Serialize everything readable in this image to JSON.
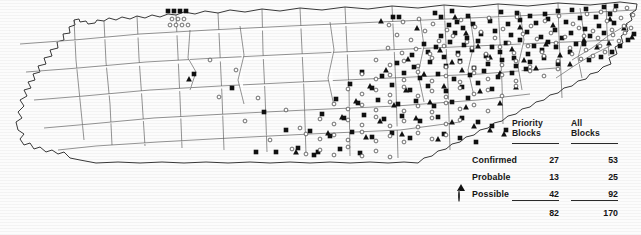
{
  "figure": {
    "type": "distribution-map",
    "region": "Tennessee",
    "background_color": "#fcfcfc",
    "line_color": "#3a3a3a"
  },
  "table": {
    "columns": [
      {
        "id": "priority",
        "line1": "Priority",
        "line2": "Blocks"
      },
      {
        "id": "all",
        "line1": "All",
        "line2": "Blocks"
      }
    ],
    "rows": [
      {
        "symbol": "filled-square",
        "label": "Confirmed",
        "priority": "27",
        "all": "53"
      },
      {
        "symbol": "filled-triangle",
        "label": "Probable",
        "priority": "13",
        "all": "25"
      },
      {
        "symbol": "open-circle",
        "label": "Possible",
        "priority": "42",
        "all": "92"
      }
    ],
    "totals": {
      "priority": "82",
      "all": "170"
    }
  },
  "chart_data": {
    "type": "map",
    "title": "",
    "legend_position": "bottom-right",
    "categories": [
      "Confirmed",
      "Probable",
      "Possible"
    ],
    "series": [
      {
        "name": "Priority Blocks",
        "values": [
          27,
          13,
          42
        ],
        "total": 82
      },
      {
        "name": "All Blocks",
        "values": [
          53,
          25,
          92
        ],
        "total": 170
      }
    ],
    "symbols": {
      "Confirmed": "filled-square",
      "Probable": "filled-triangle",
      "Possible": "open-circle"
    },
    "markers": {
      "confirmed": [
        [
          168,
          11
        ],
        [
          174,
          11
        ],
        [
          180,
          11
        ],
        [
          186,
          11
        ],
        [
          393,
          17
        ],
        [
          399,
          17
        ],
        [
          435,
          13
        ],
        [
          441,
          17
        ],
        [
          452,
          11
        ],
        [
          468,
          16
        ],
        [
          501,
          12
        ],
        [
          517,
          13
        ],
        [
          530,
          16
        ],
        [
          545,
          14
        ],
        [
          558,
          11
        ],
        [
          572,
          10
        ],
        [
          586,
          9
        ],
        [
          604,
          7
        ],
        [
          616,
          6
        ],
        [
          449,
          25
        ],
        [
          457,
          22
        ],
        [
          463,
          28
        ],
        [
          473,
          24
        ],
        [
          490,
          21
        ],
        [
          508,
          24
        ],
        [
          520,
          20
        ],
        [
          536,
          23
        ],
        [
          548,
          19
        ],
        [
          566,
          22
        ],
        [
          580,
          18
        ],
        [
          596,
          17
        ],
        [
          610,
          14
        ],
        [
          441,
          36
        ],
        [
          455,
          33
        ],
        [
          467,
          38
        ],
        [
          481,
          34
        ],
        [
          495,
          31
        ],
        [
          511,
          35
        ],
        [
          527,
          32
        ],
        [
          541,
          37
        ],
        [
          555,
          30
        ],
        [
          571,
          33
        ],
        [
          585,
          29
        ],
        [
          599,
          26
        ],
        [
          614,
          23
        ],
        [
          424,
          44
        ],
        [
          436,
          47
        ],
        [
          450,
          42
        ],
        [
          464,
          45
        ],
        [
          478,
          41
        ],
        [
          492,
          47
        ],
        [
          506,
          43
        ],
        [
          520,
          40
        ],
        [
          534,
          46
        ],
        [
          548,
          42
        ],
        [
          562,
          38
        ],
        [
          576,
          44
        ],
        [
          590,
          36
        ],
        [
          604,
          33
        ],
        [
          412,
          55
        ],
        [
          428,
          52
        ],
        [
          444,
          57
        ],
        [
          458,
          53
        ],
        [
          472,
          50
        ],
        [
          486,
          56
        ],
        [
          500,
          52
        ],
        [
          514,
          58
        ],
        [
          528,
          54
        ],
        [
          542,
          50
        ],
        [
          556,
          47
        ],
        [
          570,
          52
        ],
        [
          584,
          44
        ],
        [
          397,
          63
        ],
        [
          414,
          67
        ],
        [
          430,
          62
        ],
        [
          446,
          66
        ],
        [
          460,
          61
        ],
        [
          474,
          68
        ],
        [
          488,
          64
        ],
        [
          502,
          60
        ],
        [
          516,
          66
        ],
        [
          530,
          62
        ],
        [
          544,
          58
        ],
        [
          558,
          64
        ],
        [
          362,
          72
        ],
        [
          382,
          76
        ],
        [
          404,
          73
        ],
        [
          420,
          78
        ],
        [
          438,
          74
        ],
        [
          454,
          79
        ],
        [
          470,
          75
        ],
        [
          484,
          71
        ],
        [
          498,
          77
        ],
        [
          512,
          73
        ],
        [
          526,
          69
        ],
        [
          350,
          84
        ],
        [
          372,
          88
        ],
        [
          392,
          85
        ],
        [
          410,
          90
        ],
        [
          428,
          86
        ],
        [
          446,
          91
        ],
        [
          462,
          87
        ],
        [
          478,
          83
        ],
        [
          492,
          89
        ],
        [
          336,
          99
        ],
        [
          358,
          103
        ],
        [
          378,
          100
        ],
        [
          398,
          104
        ],
        [
          416,
          101
        ],
        [
          434,
          106
        ],
        [
          452,
          102
        ],
        [
          468,
          98
        ],
        [
          322,
          114
        ],
        [
          344,
          118
        ],
        [
          364,
          115
        ],
        [
          384,
          119
        ],
        [
          402,
          116
        ],
        [
          420,
          121
        ],
        [
          438,
          117
        ],
        [
          310,
          131
        ],
        [
          330,
          136
        ],
        [
          352,
          132
        ],
        [
          372,
          137
        ],
        [
          392,
          133
        ],
        [
          410,
          138
        ],
        [
          298,
          148
        ],
        [
          318,
          152
        ],
        [
          340,
          149
        ],
        [
          360,
          153
        ],
        [
          194,
          74
        ],
        [
          232,
          88
        ],
        [
          264,
          112
        ],
        [
          286,
          130
        ],
        [
          256,
          152
        ],
        [
          276,
          152
        ],
        [
          314,
          155
        ],
        [
          589,
          60
        ],
        [
          601,
          57
        ],
        [
          612,
          52
        ],
        [
          620,
          46
        ],
        [
          628,
          40
        ],
        [
          634,
          34
        ],
        [
          462,
          118
        ],
        [
          478,
          122
        ],
        [
          492,
          126
        ],
        [
          506,
          130
        ],
        [
          444,
          134
        ],
        [
          460,
          138
        ],
        [
          476,
          142
        ]
      ],
      "probable": [
        [
          189,
          79
        ],
        [
          381,
          21
        ],
        [
          455,
          17
        ],
        [
          417,
          28
        ],
        [
          520,
          27
        ],
        [
          466,
          33
        ],
        [
          553,
          25
        ],
        [
          440,
          50
        ],
        [
          478,
          46
        ],
        [
          512,
          49
        ],
        [
          546,
          44
        ],
        [
          584,
          40
        ],
        [
          408,
          59
        ],
        [
          452,
          62
        ],
        [
          490,
          57
        ],
        [
          524,
          60
        ],
        [
          560,
          55
        ],
        [
          386,
          70
        ],
        [
          424,
          74
        ],
        [
          462,
          70
        ],
        [
          500,
          73
        ],
        [
          536,
          68
        ],
        [
          570,
          64
        ],
        [
          370,
          86
        ],
        [
          406,
          90
        ],
        [
          444,
          86
        ],
        [
          480,
          91
        ],
        [
          516,
          87
        ],
        [
          356,
          101
        ],
        [
          394,
          105
        ],
        [
          430,
          102
        ],
        [
          466,
          107
        ],
        [
          500,
          103
        ],
        [
          342,
          117
        ],
        [
          380,
          121
        ],
        [
          416,
          118
        ],
        [
          452,
          122
        ],
        [
          328,
          133
        ],
        [
          366,
          137
        ],
        [
          402,
          134
        ],
        [
          438,
          139
        ],
        [
          296,
          152
        ],
        [
          474,
          126
        ],
        [
          490,
          130
        ],
        [
          504,
          134
        ],
        [
          610,
          19
        ],
        [
          624,
          28
        ],
        [
          632,
          37
        ],
        [
          597,
          47
        ],
        [
          609,
          43
        ]
      ],
      "possible": [
        [
          172,
          19
        ],
        [
          178,
          19
        ],
        [
          184,
          19
        ],
        [
          170,
          25
        ],
        [
          176,
          25
        ],
        [
          182,
          25
        ],
        [
          188,
          25
        ],
        [
          389,
          25
        ],
        [
          403,
          22
        ],
        [
          419,
          19
        ],
        [
          433,
          24
        ],
        [
          447,
          30
        ],
        [
          461,
          20
        ],
        [
          475,
          27
        ],
        [
          489,
          18
        ],
        [
          503,
          29
        ],
        [
          517,
          17
        ],
        [
          531,
          26
        ],
        [
          545,
          21
        ],
        [
          559,
          16
        ],
        [
          573,
          24
        ],
        [
          587,
          14
        ],
        [
          601,
          12
        ],
        [
          615,
          10
        ],
        [
          627,
          8
        ],
        [
          397,
          35
        ],
        [
          411,
          40
        ],
        [
          425,
          31
        ],
        [
          439,
          41
        ],
        [
          453,
          36
        ],
        [
          467,
          42
        ],
        [
          481,
          32
        ],
        [
          495,
          38
        ],
        [
          509,
          43
        ],
        [
          523,
          34
        ],
        [
          537,
          39
        ],
        [
          551,
          33
        ],
        [
          565,
          37
        ],
        [
          579,
          28
        ],
        [
          593,
          31
        ],
        [
          607,
          21
        ],
        [
          621,
          18
        ],
        [
          633,
          15
        ],
        [
          388,
          48
        ],
        [
          402,
          53
        ],
        [
          416,
          49
        ],
        [
          430,
          54
        ],
        [
          444,
          46
        ],
        [
          458,
          55
        ],
        [
          472,
          48
        ],
        [
          486,
          54
        ],
        [
          500,
          47
        ],
        [
          514,
          53
        ],
        [
          528,
          46
        ],
        [
          542,
          52
        ],
        [
          556,
          43
        ],
        [
          570,
          48
        ],
        [
          584,
          36
        ],
        [
          598,
          38
        ],
        [
          612,
          30
        ],
        [
          624,
          26
        ],
        [
          376,
          60
        ],
        [
          390,
          65
        ],
        [
          404,
          61
        ],
        [
          418,
          66
        ],
        [
          432,
          58
        ],
        [
          446,
          67
        ],
        [
          460,
          62
        ],
        [
          474,
          68
        ],
        [
          488,
          59
        ],
        [
          502,
          65
        ],
        [
          516,
          61
        ],
        [
          530,
          67
        ],
        [
          544,
          56
        ],
        [
          558,
          61
        ],
        [
          572,
          54
        ],
        [
          586,
          50
        ],
        [
          600,
          46
        ],
        [
          362,
          74
        ],
        [
          376,
          79
        ],
        [
          390,
          75
        ],
        [
          404,
          80
        ],
        [
          418,
          72
        ],
        [
          432,
          81
        ],
        [
          446,
          76
        ],
        [
          460,
          82
        ],
        [
          474,
          73
        ],
        [
          488,
          79
        ],
        [
          502,
          75
        ],
        [
          516,
          81
        ],
        [
          530,
          71
        ],
        [
          544,
          76
        ],
        [
          558,
          69
        ],
        [
          348,
          89
        ],
        [
          362,
          94
        ],
        [
          376,
          90
        ],
        [
          390,
          95
        ],
        [
          404,
          87
        ],
        [
          418,
          96
        ],
        [
          432,
          91
        ],
        [
          446,
          97
        ],
        [
          460,
          88
        ],
        [
          474,
          94
        ],
        [
          488,
          90
        ],
        [
          502,
          96
        ],
        [
          516,
          86
        ],
        [
          334,
          104
        ],
        [
          348,
          109
        ],
        [
          362,
          105
        ],
        [
          376,
          110
        ],
        [
          390,
          102
        ],
        [
          404,
          111
        ],
        [
          418,
          106
        ],
        [
          432,
          112
        ],
        [
          446,
          103
        ],
        [
          460,
          109
        ],
        [
          474,
          105
        ],
        [
          488,
          111
        ],
        [
          320,
          119
        ],
        [
          334,
          124
        ],
        [
          348,
          120
        ],
        [
          362,
          125
        ],
        [
          376,
          117
        ],
        [
          390,
          126
        ],
        [
          404,
          121
        ],
        [
          418,
          127
        ],
        [
          432,
          118
        ],
        [
          446,
          124
        ],
        [
          460,
          120
        ],
        [
          306,
          134
        ],
        [
          320,
          139
        ],
        [
          334,
          135
        ],
        [
          348,
          140
        ],
        [
          362,
          132
        ],
        [
          376,
          141
        ],
        [
          390,
          136
        ],
        [
          404,
          142
        ],
        [
          418,
          133
        ],
        [
          432,
          139
        ],
        [
          446,
          135
        ],
        [
          292,
          149
        ],
        [
          306,
          154
        ],
        [
          320,
          150
        ],
        [
          334,
          155
        ],
        [
          348,
          147
        ],
        [
          362,
          156
        ],
        [
          376,
          151
        ],
        [
          390,
          157
        ],
        [
          219,
          97
        ],
        [
          245,
          121
        ],
        [
          270,
          140
        ],
        [
          300,
          128
        ],
        [
          286,
          110
        ],
        [
          258,
          98
        ],
        [
          236,
          70
        ],
        [
          210,
          60
        ],
        [
          613,
          35
        ],
        [
          625,
          33
        ],
        [
          631,
          28
        ],
        [
          619,
          41
        ],
        [
          605,
          52
        ],
        [
          593,
          56
        ],
        [
          581,
          59
        ]
      ]
    }
  }
}
